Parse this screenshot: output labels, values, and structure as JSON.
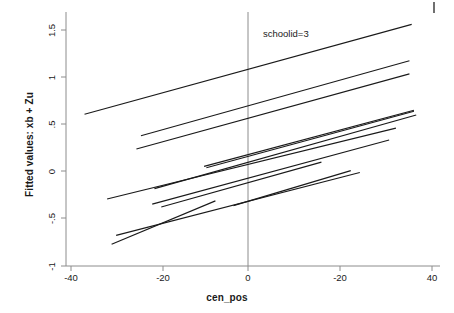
{
  "chart_data": {
    "type": "line",
    "title": "",
    "subtitle": "",
    "xlabel": "cen_pos",
    "ylabel": "Fitted values: xb + Zu",
    "xlim": [
      -40,
      40
    ],
    "ylim": [
      -1,
      1.5
    ],
    "grid": false,
    "legend": "none",
    "annotations": [
      {
        "text": "schoolid=3",
        "x": -4,
        "y": 1.31
      }
    ],
    "reference_lines": [
      {
        "orientation": "vertical",
        "value": 0,
        "color": "#808080"
      }
    ],
    "xticks": [
      -40,
      -20,
      0,
      20,
      40
    ],
    "xtick_labels": [
      "-40",
      "-20",
      "0",
      "-20",
      "40"
    ],
    "yticks": [
      -1,
      -0.5,
      0,
      0.5,
      1,
      1.5
    ],
    "ytick_labels": [
      "-1",
      "-.5",
      "0",
      ".5",
      "1",
      "1.5"
    ],
    "series_color": "#1a1a1a",
    "series_description": "Twelve fitted regression lines, one per school, each a straight segment with a positive slope drawn over that school's observed range of cen_pos.",
    "series": [
      {
        "name": "line-1",
        "x": [
          -37.0,
          35.5
        ],
        "y": [
          0.608,
          1.56
        ]
      },
      {
        "name": "line-2",
        "x": [
          -24.5,
          35.0
        ],
        "y": [
          0.38,
          1.175
        ]
      },
      {
        "name": "line-3",
        "x": [
          -25.5,
          35.0
        ],
        "y": [
          0.24,
          1.035
        ]
      },
      {
        "name": "line-4",
        "x": [
          -10.5,
          36.0
        ],
        "y": [
          0.055,
          0.65
        ]
      },
      {
        "name": "line-5",
        "x": [
          -10.0,
          36.0
        ],
        "y": [
          0.04,
          0.64
        ]
      },
      {
        "name": "line-6",
        "x": [
          -21.5,
          36.5
        ],
        "y": [
          -0.18,
          0.6
        ]
      },
      {
        "name": "line-7",
        "x": [
          -32.0,
          32.0
        ],
        "y": [
          -0.29,
          0.46
        ]
      },
      {
        "name": "line-8",
        "x": [
          -22.0,
          30.5
        ],
        "y": [
          -0.345,
          0.335
        ]
      },
      {
        "name": "line-9",
        "x": [
          -20.0,
          15.5
        ],
        "y": [
          -0.375,
          0.1
        ]
      },
      {
        "name": "line-10",
        "x": [
          -30.0,
          24.0
        ],
        "y": [
          -0.675,
          -0.01
        ]
      },
      {
        "name": "line-11",
        "x": [
          -31.0,
          -8.0
        ],
        "y": [
          -0.77,
          -0.31
        ]
      },
      {
        "name": "line-12",
        "x": [
          -4.0,
          22.0
        ],
        "y": [
          -0.36,
          0.01
        ]
      }
    ]
  },
  "axes": {
    "x_title": "cen_pos",
    "y_title": "Fitted values: xb + Zu"
  },
  "annotation": {
    "schoolid_label": "schoolid=3"
  },
  "x_ticks": [
    {
      "label": "-40"
    },
    {
      "label": "-20"
    },
    {
      "label": "0"
    },
    {
      "label": "-20"
    },
    {
      "label": "40"
    }
  ],
  "y_ticks": [
    {
      "label": "1.5"
    },
    {
      "label": "1"
    },
    {
      "label": ".5"
    },
    {
      "label": "0"
    },
    {
      "label": "-.5"
    },
    {
      "label": "-1"
    }
  ]
}
